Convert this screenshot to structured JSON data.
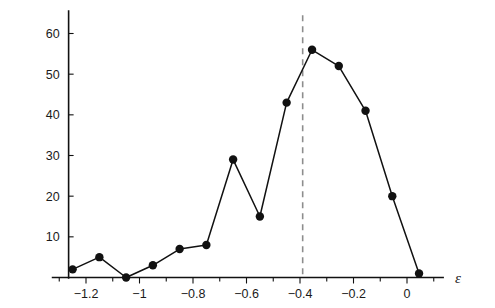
{
  "chart_data": {
    "type": "line",
    "title": "",
    "subtitle": "",
    "xlabel": "ε",
    "ylabel": "",
    "xlim": [
      -1.33,
      0.13
    ],
    "ylim": [
      0,
      65
    ],
    "grid": false,
    "legend": null,
    "x_ticks": [
      -1.2,
      -1,
      -0.8,
      -0.6,
      -0.4,
      -0.2,
      0
    ],
    "x_tick_labels": [
      "−1.2",
      "−1",
      "−0.8",
      "−0.6",
      "−0.4",
      "−0.2",
      "0"
    ],
    "x_minor_ticks": [
      -1.3,
      -1.1,
      -0.9,
      -0.7,
      -0.5,
      -0.3,
      -0.1,
      0.1
    ],
    "y_ticks": [
      10,
      20,
      30,
      40,
      50,
      60
    ],
    "y_tick_labels": [
      "10",
      "20",
      "30",
      "40",
      "50",
      "60"
    ],
    "marker": "filled-circle",
    "marker_color": "#111111",
    "line_color": "#111111",
    "series": [
      {
        "name": "counts",
        "x": [
          -1.25,
          -1.15,
          -1.05,
          -0.95,
          -0.85,
          -0.75,
          -0.65,
          -0.55,
          -0.45,
          -0.355,
          -0.255,
          -0.155,
          -0.055,
          0.045
        ],
        "values": [
          2,
          5,
          0,
          3,
          7,
          8,
          29,
          15,
          43,
          56,
          52,
          41,
          20,
          1
        ]
      }
    ],
    "annotations": [
      {
        "type": "vertical-dashed-line",
        "x": -0.39,
        "color": "#8d8d8d",
        "label": ""
      }
    ]
  },
  "figure": {
    "background": "#ffffff",
    "axis_color": "#111111"
  }
}
